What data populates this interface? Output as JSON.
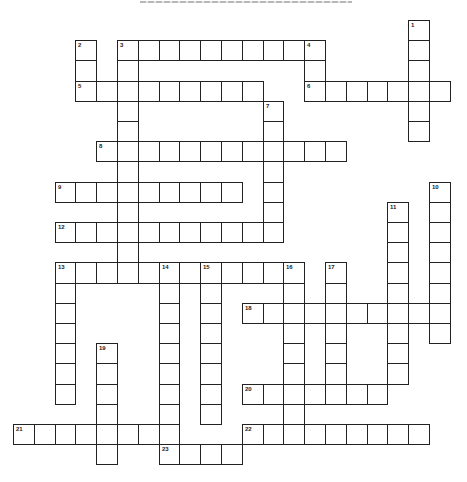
{
  "puzzle": {
    "title": "",
    "grid": {
      "origin_x": 13,
      "origin_y": 20,
      "cell_w": 20.8,
      "cell_h": 20.2,
      "border_color": "#222222",
      "cell_fill": "#ffffff"
    },
    "entries": [
      {
        "number": "1",
        "dir": "down",
        "col": 19,
        "row": 0,
        "length": 6
      },
      {
        "number": "2",
        "dir": "down",
        "col": 3,
        "row": 1,
        "length": 3
      },
      {
        "number": "3",
        "dir": "across",
        "col": 5,
        "row": 1,
        "length": 10
      },
      {
        "number": "3",
        "dir": "down",
        "col": 5,
        "row": 1,
        "length": 12
      },
      {
        "number": "4",
        "dir": "down",
        "col": 14,
        "row": 1,
        "length": 3
      },
      {
        "number": "5",
        "dir": "across",
        "col": 3,
        "row": 3,
        "length": 9
      },
      {
        "number": "6",
        "dir": "across",
        "col": 14,
        "row": 3,
        "length": 7
      },
      {
        "number": "7",
        "dir": "down",
        "col": 12,
        "row": 4,
        "length": 7
      },
      {
        "number": "8",
        "dir": "across",
        "col": 4,
        "row": 6,
        "length": 12
      },
      {
        "number": "9",
        "dir": "across",
        "col": 2,
        "row": 8,
        "length": 9
      },
      {
        "number": "10",
        "dir": "down",
        "col": 20,
        "row": 8,
        "length": 8
      },
      {
        "number": "11",
        "dir": "down",
        "col": 18,
        "row": 9,
        "length": 9
      },
      {
        "number": "12",
        "dir": "across",
        "col": 2,
        "row": 10,
        "length": 11
      },
      {
        "number": "13",
        "dir": "across",
        "col": 2,
        "row": 12,
        "length": 12
      },
      {
        "number": "13",
        "dir": "down",
        "col": 2,
        "row": 12,
        "length": 7
      },
      {
        "number": "14",
        "dir": "down",
        "col": 7,
        "row": 12,
        "length": 10
      },
      {
        "number": "15",
        "dir": "down",
        "col": 9,
        "row": 12,
        "length": 8
      },
      {
        "number": "16",
        "dir": "down",
        "col": 13,
        "row": 12,
        "length": 9
      },
      {
        "number": "17",
        "dir": "down",
        "col": 15,
        "row": 12,
        "length": 7
      },
      {
        "number": "18",
        "dir": "across",
        "col": 11,
        "row": 14,
        "length": 10
      },
      {
        "number": "19",
        "dir": "down",
        "col": 4,
        "row": 16,
        "length": 6
      },
      {
        "number": "20",
        "dir": "across",
        "col": 11,
        "row": 18,
        "length": 7
      },
      {
        "number": "21",
        "dir": "across",
        "col": 0,
        "row": 20,
        "length": 8
      },
      {
        "number": "22",
        "dir": "across",
        "col": 11,
        "row": 20,
        "length": 9
      },
      {
        "number": "23",
        "dir": "across",
        "col": 7,
        "row": 21,
        "length": 4
      }
    ]
  }
}
